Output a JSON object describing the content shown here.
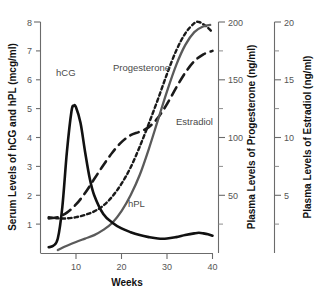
{
  "chart_data": {
    "type": "line",
    "title": "",
    "xlabel": "Weeks",
    "xlim": [
      4,
      40
    ],
    "xticks": [
      10,
      20,
      30,
      40
    ],
    "xticklabels": [
      "10",
      "20",
      "30",
      "40"
    ],
    "grid": false,
    "legend_position": "inline-annotations",
    "axes": [
      {
        "id": "left",
        "label": "Serum Levels of hCG and hPL (mcg/ml)",
        "unit": "mcg/ml",
        "lim": [
          0,
          8
        ],
        "ticks": [
          1,
          2,
          3,
          4,
          5,
          6,
          7,
          8
        ],
        "ticklabels": [
          "1",
          "2",
          "3",
          "4",
          "5",
          "6",
          "7",
          "8"
        ],
        "series": [
          "hCG",
          "hPL"
        ]
      },
      {
        "id": "right-inner",
        "label": "Plasma Levels of Progesterone (ng/ml)",
        "unit": "ng/ml",
        "lim": [
          0,
          200
        ],
        "ticks": [
          50,
          100,
          150,
          200
        ],
        "ticklabels": [
          "50",
          "100",
          "150",
          "200"
        ],
        "minor_ticks": [
          25,
          75,
          125,
          175
        ],
        "series": [
          "Progesterone"
        ]
      },
      {
        "id": "right-outer",
        "label": "Plasma Levels of Estradiol (ng/ml)",
        "unit": "ng/ml",
        "lim": [
          0,
          20
        ],
        "ticks": [
          5,
          10,
          15,
          20
        ],
        "ticklabels": [
          "5",
          "10",
          "15",
          "20"
        ],
        "minor_ticks": [
          2.5,
          7.5,
          12.5,
          17.5
        ],
        "series": [
          "Estradiol"
        ]
      }
    ],
    "series": [
      {
        "name": "hCG",
        "label": "hCG",
        "axis": "left",
        "style": "solid",
        "color": "#111111",
        "x": [
          4,
          5,
          6,
          7,
          8,
          9,
          9.5,
          10,
          11,
          12,
          13,
          14,
          16,
          18,
          20,
          22,
          24,
          26,
          28,
          30,
          32,
          34,
          36,
          37,
          38,
          39,
          40
        ],
        "values": [
          0.2,
          0.25,
          0.5,
          1.6,
          3.5,
          4.9,
          5.1,
          5.05,
          4.5,
          3.5,
          2.6,
          2.0,
          1.35,
          1.05,
          0.85,
          0.72,
          0.62,
          0.55,
          0.5,
          0.5,
          0.55,
          0.62,
          0.68,
          0.7,
          0.68,
          0.65,
          0.6
        ]
      },
      {
        "name": "hPL",
        "label": "hPL",
        "axis": "left",
        "style": "solid",
        "color": "#5a5a5a",
        "x": [
          6,
          7,
          8,
          10,
          12,
          14,
          16,
          18,
          20,
          22,
          24,
          26,
          28,
          30,
          32,
          34,
          36,
          38,
          39.5
        ],
        "values": [
          0.1,
          0.18,
          0.25,
          0.38,
          0.5,
          0.62,
          0.8,
          1.05,
          1.45,
          2.0,
          2.7,
          3.6,
          4.6,
          5.6,
          6.5,
          7.2,
          7.65,
          7.85,
          7.9
        ]
      },
      {
        "name": "Estradiol",
        "label": "Estradiol",
        "axis": "right-outer",
        "style": "long-dash",
        "color": "#1a1a1a",
        "x": [
          4,
          6,
          8,
          10,
          12,
          14,
          16,
          18,
          20,
          22,
          24,
          26,
          28,
          30,
          32,
          34,
          36,
          38,
          40
        ],
        "values": [
          3.0,
          3.1,
          3.5,
          4.2,
          5.2,
          6.4,
          7.6,
          8.7,
          9.6,
          10.2,
          10.5,
          10.9,
          11.7,
          12.9,
          14.3,
          15.6,
          16.6,
          17.2,
          17.5
        ]
      },
      {
        "name": "Progesterone",
        "label": "Progesterone",
        "axis": "right-inner",
        "style": "short-dash",
        "color": "#1a1a1a",
        "x": [
          4,
          6,
          8,
          10,
          12,
          14,
          16,
          18,
          20,
          22,
          24,
          26,
          28,
          30,
          32,
          34,
          36,
          37,
          38,
          39,
          40
        ],
        "values": [
          31,
          30,
          30,
          31,
          33,
          36,
          41,
          49,
          60,
          74,
          92,
          112,
          133,
          155,
          175,
          190,
          199,
          200,
          198,
          195,
          191
        ]
      }
    ],
    "annotations": [
      {
        "text": "hCG",
        "x": 8.2,
        "y_left": 5.75
      },
      {
        "text": "hPL",
        "x": 23.0,
        "y_left": 1.85
      },
      {
        "text": "Progesterone",
        "x": 19.0,
        "y_left": 6.35
      },
      {
        "text": "Estradiol",
        "x": 31.0,
        "y_left": 4.55
      }
    ]
  }
}
